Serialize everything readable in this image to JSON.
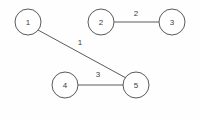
{
  "diagram": {
    "canvas": {
      "width": 201,
      "height": 121,
      "background": "#fefefe"
    },
    "style": {
      "stroke_color": "#5a5a5a",
      "node_fill": "#ffffff",
      "text_color": "#3d3d3d",
      "node_radius": 13,
      "stroke_width": 1
    },
    "nodes": [
      {
        "id": "1",
        "label": "1",
        "x": 28,
        "y": 22
      },
      {
        "id": "2",
        "label": "2",
        "x": 101,
        "y": 22
      },
      {
        "id": "3",
        "label": "3",
        "x": 172,
        "y": 22
      },
      {
        "id": "4",
        "label": "4",
        "x": 65,
        "y": 85
      },
      {
        "id": "5",
        "label": "5",
        "x": 136,
        "y": 85
      }
    ],
    "edges": [
      {
        "id": "edge-1-5",
        "from": "1",
        "to": "5",
        "weight": "1",
        "x1": 38,
        "y1": 30,
        "x2": 126,
        "y2": 78,
        "label_x": 80,
        "label_y": 42
      },
      {
        "id": "edge-2-3",
        "from": "2",
        "to": "3",
        "weight": "2",
        "x1": 114,
        "y1": 22,
        "x2": 159,
        "y2": 22,
        "label_x": 136,
        "label_y": 13
      },
      {
        "id": "edge-4-5",
        "from": "4",
        "to": "5",
        "weight": "3",
        "x1": 78,
        "y1": 85,
        "x2": 123,
        "y2": 85,
        "label_x": 98,
        "label_y": 74
      }
    ]
  }
}
